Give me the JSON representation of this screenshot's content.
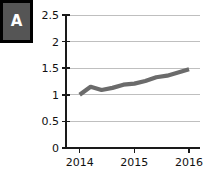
{
  "panel": {
    "label": "A",
    "badge_bg": "#555555",
    "badge_border": "#000000",
    "badge_text_color": "#ffffff"
  },
  "chart_data": {
    "type": "line",
    "title": "",
    "subtitle": "",
    "xlabel": "",
    "ylabel": "",
    "xlim": [
      2013.75,
      2016.2
    ],
    "ylim": [
      0,
      2.5
    ],
    "yticks": [
      0,
      0.5,
      1,
      1.5,
      2,
      2.5
    ],
    "ytick_labels": [
      "0",
      "0.5",
      "1",
      "1.5",
      "2",
      "2.5"
    ],
    "xticks": [
      2014,
      2015,
      2016
    ],
    "xtick_labels": [
      "2014",
      "2015",
      "2016"
    ],
    "grid": "horizontal",
    "grid_color": "#bfbfbf",
    "legend": "none",
    "series": [
      {
        "name": "series-1",
        "color": "#6b6b6b",
        "line_width": 4.2,
        "x": [
          2014.0,
          2014.2,
          2014.4,
          2014.6,
          2014.8,
          2015.0,
          2015.2,
          2015.4,
          2015.6,
          2015.8,
          2016.0
        ],
        "values": [
          1.0,
          1.15,
          1.09,
          1.13,
          1.19,
          1.21,
          1.26,
          1.33,
          1.36,
          1.42,
          1.48
        ]
      }
    ]
  },
  "axes_geometry": {
    "plot_left": 66,
    "plot_right": 200,
    "plot_top": 15,
    "plot_bottom": 148
  }
}
